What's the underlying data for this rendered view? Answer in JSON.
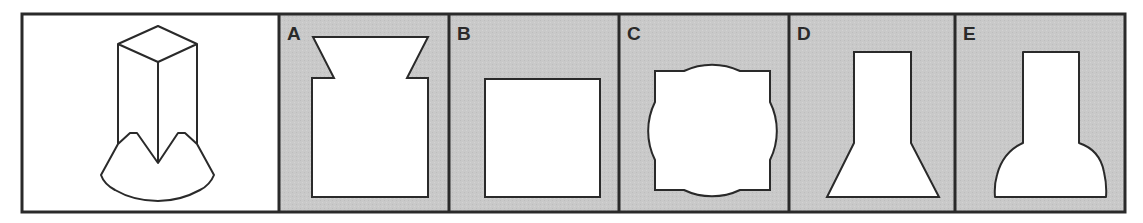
{
  "puzzle": {
    "question_panel": {
      "label": "",
      "description": "3D rectangular prism standing on a curved base with two pointed peaks"
    },
    "options": [
      {
        "label": "A",
        "description": "Rectangle with inverted trapezoid top flaring outward"
      },
      {
        "label": "B",
        "description": "Square"
      },
      {
        "label": "C",
        "description": "Square combined with a circle (bulging arcs on each side)"
      },
      {
        "label": "D",
        "description": "Narrow rectangle on top of a straight-sided trapezoid base"
      },
      {
        "label": "E",
        "description": "Narrow rectangle on top of a curved bell-shaped base"
      }
    ]
  },
  "colors": {
    "option_background": "#c8c8c8",
    "question_background": "#ffffff",
    "stroke": "#2a2a2a",
    "shape_fill": "#ffffff"
  }
}
